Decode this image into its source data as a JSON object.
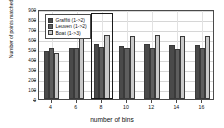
{
  "chart_data": {
    "type": "bar",
    "title": "",
    "xlabel": "number of bins",
    "ylabel": "Number of points matched",
    "categories": [
      "4",
      "6",
      "8",
      "10",
      "12",
      "14",
      "16"
    ],
    "series": [
      {
        "name": "Graffiti (1->2)",
        "color": "#4a4a4a",
        "values": [
          480,
          515,
          555,
          535,
          550,
          540,
          545
        ]
      },
      {
        "name": "Leuven (1->2)",
        "color": "#5e5e5e",
        "values": [
          510,
          515,
          520,
          510,
          510,
          505,
          515
        ]
      },
      {
        "name": "Boat (1->3)",
        "color": "#c9c9c9",
        "values": [
          465,
          615,
          640,
          635,
          640,
          635,
          630
        ]
      }
    ],
    "ylim": [
      0,
      900
    ],
    "yticks": [
      0,
      100,
      200,
      300,
      400,
      500,
      600,
      700,
      800,
      900
    ],
    "ytick_labels": [
      "0",
      "100",
      "200",
      "300",
      "400",
      "500",
      "600",
      "700",
      "800",
      "900"
    ],
    "grid": true,
    "legend_position": "upper left",
    "highlight": {
      "category": "8",
      "label": "selected-bin-count"
    }
  }
}
